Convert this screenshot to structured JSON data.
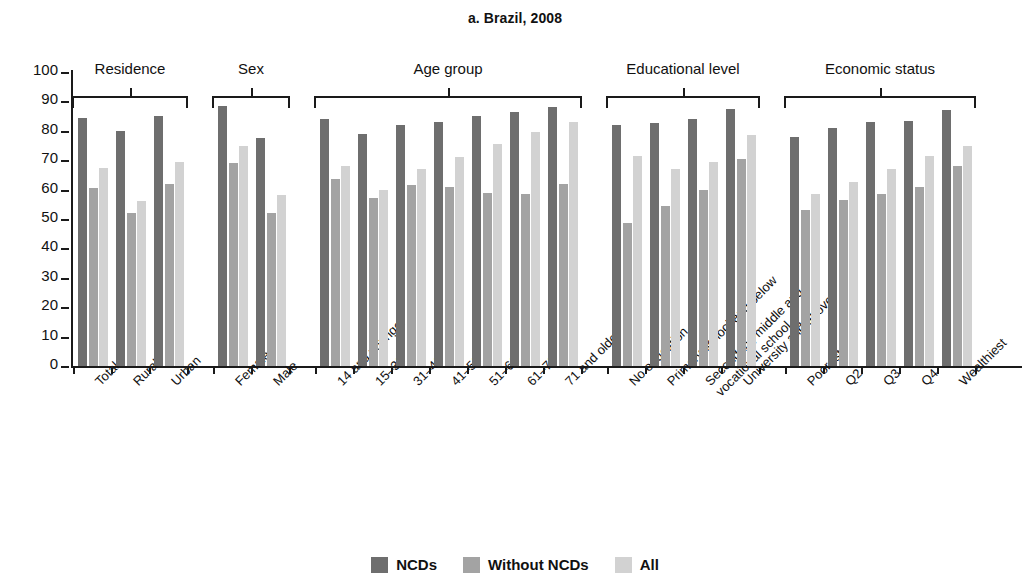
{
  "chart_data": {
    "type": "bar",
    "title": "a. Brazil, 2008",
    "xlabel": "",
    "ylabel": "Percent",
    "ylim": [
      0,
      100
    ],
    "ytick_step": 10,
    "yticks": [
      100,
      90,
      80,
      70,
      60,
      50,
      40,
      30,
      20,
      10,
      0
    ],
    "grid": false,
    "legend_position": "bottom",
    "series": [
      {
        "name": "NCDs",
        "color": "#6e6e6e",
        "values": [
          84.5,
          80.0,
          85.0,
          88.5,
          77.5,
          84.0,
          79.0,
          82.0,
          83.0,
          85.0,
          86.5,
          88.0,
          82.0,
          82.5,
          84.0,
          87.5,
          78.0,
          81.0,
          83.0,
          83.5,
          87.0
        ]
      },
      {
        "name": "Without NCDs",
        "color": "#a3a3a3",
        "values": [
          60.5,
          52.0,
          62.0,
          69.0,
          52.0,
          63.5,
          57.0,
          61.5,
          61.0,
          59.0,
          58.5,
          62.0,
          48.5,
          54.5,
          60.0,
          70.5,
          53.0,
          56.5,
          58.5,
          61.0,
          68.0
        ]
      },
      {
        "name": "All",
        "color": "#d2d2d2",
        "values": [
          67.5,
          56.0,
          69.5,
          75.0,
          58.0,
          68.0,
          60.0,
          67.0,
          71.0,
          75.5,
          79.5,
          83.0,
          71.5,
          67.0,
          69.5,
          78.5,
          58.5,
          62.5,
          67.0,
          71.5,
          75.0
        ]
      }
    ],
    "categories": [
      "Total",
      "Rural",
      "Urban",
      "Female",
      "Male",
      "14 and younger",
      "15–30",
      "31–40",
      "41–50",
      "51–60",
      "61–70",
      "71 and older",
      "No education",
      "Primary school and below",
      "Secondary, middle and\nvocational school",
      "University and above",
      "Poorest",
      "Q2",
      "Q3",
      "Q4",
      "Wealthiest"
    ],
    "groups": [
      {
        "label": "Residence",
        "start": 0,
        "count": 3
      },
      {
        "label": "Sex",
        "start": 3,
        "count": 2
      },
      {
        "label": "Age group",
        "start": 5,
        "count": 7
      },
      {
        "label": "Educational level",
        "start": 12,
        "count": 4
      },
      {
        "label": "Economic status",
        "start": 16,
        "count": 5
      }
    ]
  },
  "legend": {
    "items": [
      {
        "label": "NCDs",
        "key": "ncds"
      },
      {
        "label": "Without NCDs",
        "key": "without"
      },
      {
        "label": "All",
        "key": "all"
      }
    ]
  }
}
